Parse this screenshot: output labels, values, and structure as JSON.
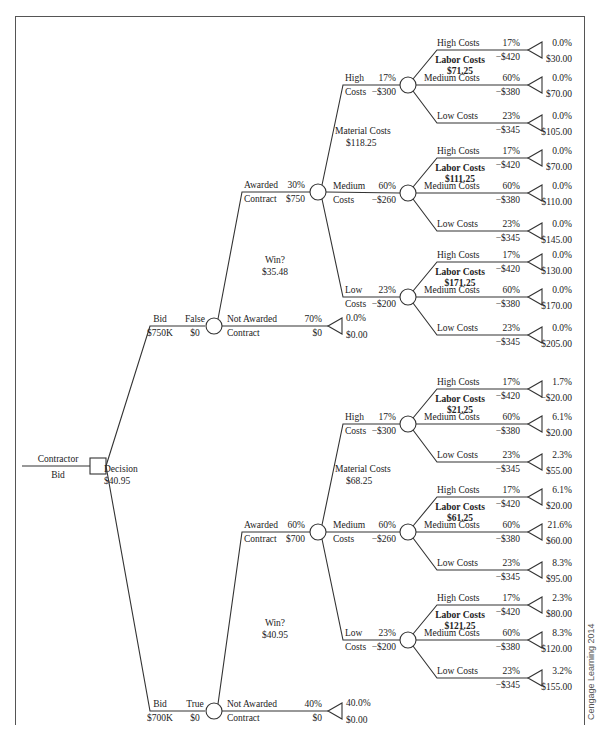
{
  "root": {
    "label_top": "Contractor",
    "label_bottom": "Bid",
    "node_label": "Decision",
    "node_value": "$40.95"
  },
  "branches": [
    {
      "name": "Bid",
      "amount": "$750K",
      "flag": "False",
      "flag_value": "$0",
      "win_label": "Win?",
      "win_value": "$35.48",
      "awarded": {
        "l1": "Awarded",
        "l2": "Contract",
        "prob": "30%",
        "value": "$750"
      },
      "not_awarded": {
        "l1": "Not Awarded",
        "l2": "Contract",
        "prob": "70%",
        "value": "$0",
        "end_prob": "0.0%",
        "end_value": "$0.00"
      },
      "material": {
        "label": "Material Costs",
        "value": "$118.25"
      },
      "materials": [
        {
          "l1": "High",
          "l2": "Costs",
          "prob": "17%",
          "cost": "−$300",
          "labor_value": "$71.25",
          "ends": [
            {
              "prob": "0.0%",
              "value": "$30.00"
            },
            {
              "prob": "0.0%",
              "value": "$70.00"
            },
            {
              "prob": "0.0%",
              "value": "$105.00"
            }
          ]
        },
        {
          "l1": "Medium",
          "l2": "Costs",
          "prob": "60%",
          "cost": "−$260",
          "labor_value": "$111.25",
          "ends": [
            {
              "prob": "0.0%",
              "value": "$70.00"
            },
            {
              "prob": "0.0%",
              "value": "$110.00"
            },
            {
              "prob": "0.0%",
              "value": "$145.00"
            }
          ]
        },
        {
          "l1": "Low",
          "l2": "Costs",
          "prob": "23%",
          "cost": "−$200",
          "labor_value": "$171.25",
          "ends": [
            {
              "prob": "0.0%",
              "value": "$130.00"
            },
            {
              "prob": "0.0%",
              "value": "$170.00"
            },
            {
              "prob": "0.0%",
              "value": "$205.00"
            }
          ]
        }
      ]
    },
    {
      "name": "Bid",
      "amount": "$700K",
      "flag": "True",
      "flag_value": "$0",
      "win_label": "Win?",
      "win_value": "$40.95",
      "awarded": {
        "l1": "Awarded",
        "l2": "Contract",
        "prob": "60%",
        "value": "$700"
      },
      "not_awarded": {
        "l1": "Not Awarded",
        "l2": "Contract",
        "prob": "40%",
        "value": "$0",
        "end_prob": "40.0%",
        "end_value": "$0.00"
      },
      "material": {
        "label": "Material Costs",
        "value": "$68.25"
      },
      "materials": [
        {
          "l1": "High",
          "l2": "Costs",
          "prob": "17%",
          "cost": "−$300",
          "labor_value": "$21.25",
          "ends": [
            {
              "prob": "1.7%",
              "value": "−$20.00"
            },
            {
              "prob": "6.1%",
              "value": "$20.00"
            },
            {
              "prob": "2.3%",
              "value": "$55.00"
            }
          ]
        },
        {
          "l1": "Medium",
          "l2": "Costs",
          "prob": "60%",
          "cost": "−$260",
          "labor_value": "$61.25",
          "ends": [
            {
              "prob": "6.1%",
              "value": "$20.00"
            },
            {
              "prob": "21.6%",
              "value": "$60.00"
            },
            {
              "prob": "8.3%",
              "value": "$95.00"
            }
          ]
        },
        {
          "l1": "Low",
          "l2": "Costs",
          "prob": "23%",
          "cost": "−$200",
          "labor_value": "$121.25",
          "ends": [
            {
              "prob": "2.3%",
              "value": "$80.00"
            },
            {
              "prob": "8.3%",
              "value": "$120.00"
            },
            {
              "prob": "3.2%",
              "value": "$155.00"
            }
          ]
        }
      ]
    }
  ],
  "labor": {
    "label": "Labor Costs",
    "options": [
      {
        "label": "High Costs",
        "prob": "17%",
        "cost": "−$420"
      },
      {
        "label": "Medium Costs",
        "prob": "60%",
        "cost": "−$380"
      },
      {
        "label": "Low Costs",
        "prob": "23%",
        "cost": "−$345"
      }
    ]
  },
  "credit": "Cengage Learning 2014",
  "colors": {
    "line": "#333333",
    "text": "#222222",
    "frame": "#555555"
  }
}
